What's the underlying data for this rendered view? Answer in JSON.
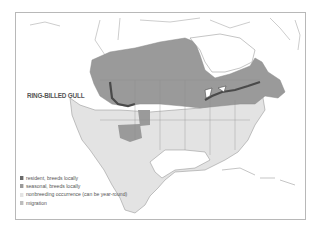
{
  "map": {
    "title": "RING-BILLED GULL",
    "colors": {
      "resident": "#6a6a6a",
      "seasonal": "#9a9a9a",
      "nonbreeding": "#e3e3e3",
      "migration": "#bdbdbd",
      "land": "#ffffff",
      "outline": "#8a8a8a"
    },
    "legend": [
      {
        "key": "resident",
        "label": "resident, breeds locally"
      },
      {
        "key": "seasonal",
        "label": "seasonal, breeds locally"
      },
      {
        "key": "nonbreeding",
        "label": "nonbreeding occurrence (can be year-round)"
      },
      {
        "key": "migration",
        "label": "migration"
      }
    ]
  }
}
